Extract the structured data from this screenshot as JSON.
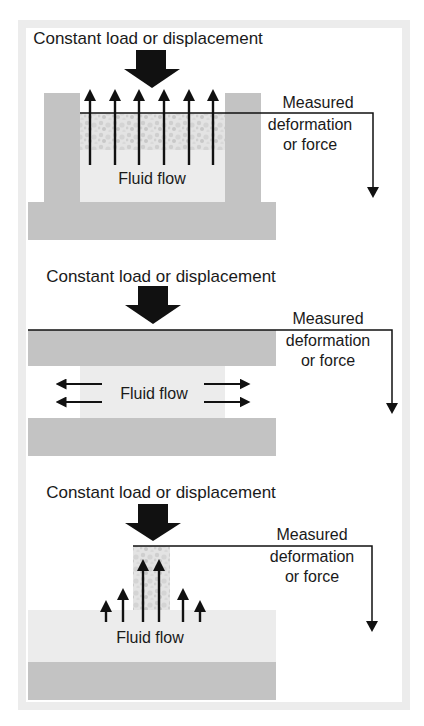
{
  "diagram": {
    "colors": {
      "frame": "#ececec",
      "plate": "#c3c3c3",
      "fluid": "#ececec",
      "grain_light": "#e6e6e6",
      "grain_dark": "#c9c9c9",
      "ink": "#111111"
    },
    "panels": [
      {
        "name": "confined-compression",
        "load_label": "Constant load or displacement",
        "measure_label": [
          "Measured",
          "deformation",
          "or force"
        ],
        "flow_label": "Fluid flow"
      },
      {
        "name": "unconfined-compression",
        "load_label": "Constant load or displacement",
        "measure_label": [
          "Measured",
          "deformation",
          "or force"
        ],
        "flow_label": "Fluid flow"
      },
      {
        "name": "indentation",
        "load_label": "Constant load or displacement",
        "measure_label": [
          "Measured",
          "deformation",
          "or force"
        ],
        "flow_label": "Fluid flow"
      }
    ]
  }
}
